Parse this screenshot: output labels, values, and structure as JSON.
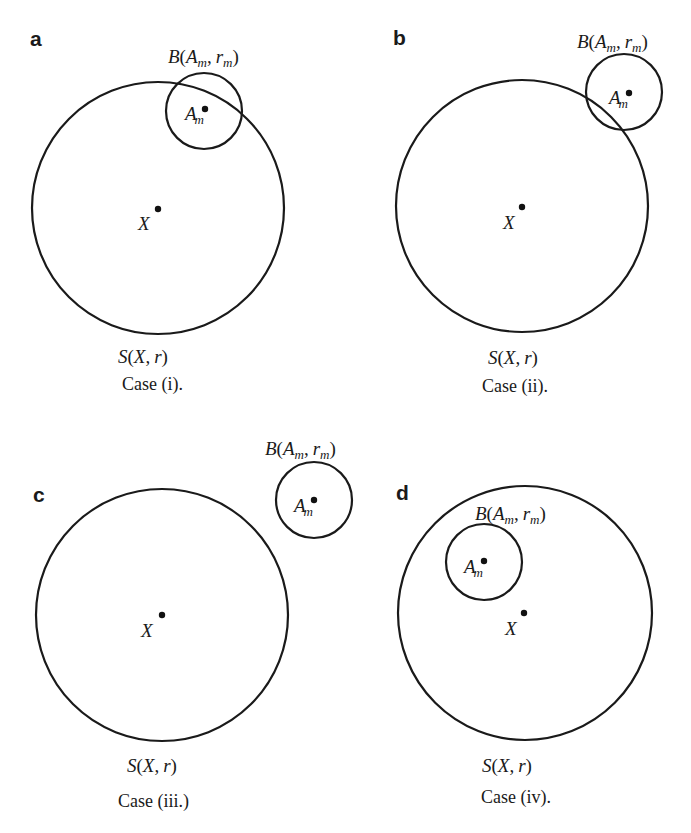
{
  "figure": {
    "panels": [
      {
        "id": "a",
        "letter": "a",
        "big_circle_label": "S(X, r)",
        "big_center_label": "X",
        "small_circle_label": "B(A_m, r_m)",
        "small_center_label": "A_m",
        "caption": "Case (i).",
        "relation": "small circle intersects sphere, center inside"
      },
      {
        "id": "b",
        "letter": "b",
        "big_circle_label": "S(X, r)",
        "big_center_label": "X",
        "small_circle_label": "B(A_m, r_m)",
        "small_center_label": "A_m",
        "caption": "Case (ii).",
        "relation": "small circle intersects sphere, center outside"
      },
      {
        "id": "c",
        "letter": "c",
        "big_circle_label": "S(X, r)",
        "big_center_label": "X",
        "small_circle_label": "B(A_m, r_m)",
        "small_center_label": "A_m",
        "caption": "Case (iii.)",
        "relation": "small circle entirely outside"
      },
      {
        "id": "d",
        "letter": "d",
        "big_circle_label": "S(X, r)",
        "big_center_label": "X",
        "small_circle_label": "B(A_m, r_m)",
        "small_center_label": "A_m",
        "caption": "Case (iv).",
        "relation": "small circle entirely inside"
      }
    ],
    "text": {
      "B": "B",
      "S": "S",
      "A": "A",
      "m": "m",
      "r": "r",
      "X": "X",
      "open": "(",
      "close": ")",
      "comma": ","
    }
  }
}
